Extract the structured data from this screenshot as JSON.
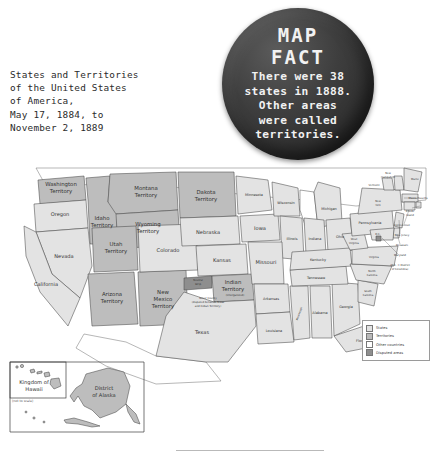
{
  "title": {
    "text": "States and Territories\nof the United States\nof America,\nMay 17, 1884, to\nNovember 2, 1889"
  },
  "badge": {
    "word1": "MAP",
    "word2": "FACT",
    "fact": "There were 38\nstates in 1888.\nOther areas\nwere called\nterritories."
  },
  "legend": {
    "items": [
      {
        "label": "States",
        "color": "#e2e2e2"
      },
      {
        "label": "Territories",
        "color": "#b9b9b9"
      },
      {
        "label": "Other countries",
        "color": "#ffffff"
      },
      {
        "label": "Disputed areas",
        "color": "#8e8e8e"
      }
    ]
  },
  "map": {
    "states": [
      {
        "name": "Oregon"
      },
      {
        "name": "California"
      },
      {
        "name": "Nevada"
      },
      {
        "name": "Colorado"
      },
      {
        "name": "Nebraska"
      },
      {
        "name": "Kansas"
      },
      {
        "name": "Texas"
      },
      {
        "name": "Minnesota"
      },
      {
        "name": "Iowa"
      },
      {
        "name": "Missouri"
      },
      {
        "name": "Arkansas"
      },
      {
        "name": "Louisiana"
      },
      {
        "name": "Wisconsin"
      },
      {
        "name": "Illinois"
      },
      {
        "name": "Indiana"
      },
      {
        "name": "Michigan"
      },
      {
        "name": "Ohio"
      },
      {
        "name": "Kentucky"
      },
      {
        "name": "Tennessee"
      },
      {
        "name": "Mississippi"
      },
      {
        "name": "Alabama"
      },
      {
        "name": "Georgia"
      },
      {
        "name": "Florida"
      },
      {
        "name": "South Carolina"
      },
      {
        "name": "North Carolina"
      },
      {
        "name": "Virginia"
      },
      {
        "name": "West Virginia"
      },
      {
        "name": "Pennsylvania"
      },
      {
        "name": "New York"
      },
      {
        "name": "Vermont"
      },
      {
        "name": "New Hampshire"
      },
      {
        "name": "Maine"
      },
      {
        "name": "Massachusetts"
      },
      {
        "name": "Rhode Island"
      },
      {
        "name": "Connecticut"
      },
      {
        "name": "New Jersey"
      },
      {
        "name": "Delaware"
      },
      {
        "name": "Maryland"
      }
    ],
    "territories": [
      {
        "name": "Washington Territory"
      },
      {
        "name": "Idaho Territory"
      },
      {
        "name": "Montana Territory"
      },
      {
        "name": "Dakota Territory"
      },
      {
        "name": "Wyoming Territory"
      },
      {
        "name": "Utah Territory"
      },
      {
        "name": "Arizona Territory"
      },
      {
        "name": "New Mexico Territory"
      },
      {
        "name": "Indian Territory"
      }
    ],
    "annotations": {
      "dc_marker": "D.C.",
      "dc_note": "(D.C. = District\nof Columbia)",
      "neutral_strip": "Neutral\nStrip",
      "greer_county": "Greer County\n(disputed between Texas\nand Indian Territory)",
      "unorganized": "(Unorganized)"
    }
  },
  "insets": {
    "hawaii": {
      "label": "Kingdom of\nHawaii",
      "note": "(not to scale)"
    },
    "alaska": {
      "label": "District\nof Alaska"
    }
  }
}
